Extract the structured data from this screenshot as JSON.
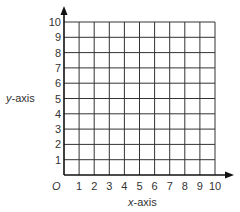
{
  "chart_data": {
    "type": "coordinate-grid",
    "xlabel": "x-axis",
    "ylabel": "y-axis",
    "origin_label": "O",
    "x_ticks": [
      "1",
      "2",
      "3",
      "4",
      "5",
      "6",
      "7",
      "8",
      "9",
      "10"
    ],
    "y_ticks": [
      "1",
      "2",
      "3",
      "4",
      "5",
      "6",
      "7",
      "8",
      "9",
      "10"
    ],
    "xlim": [
      0,
      10
    ],
    "ylim": [
      0,
      10
    ],
    "grid": true,
    "points": []
  },
  "colors": {
    "grid": "#333333",
    "axis": "#111111",
    "text": "#333333"
  }
}
